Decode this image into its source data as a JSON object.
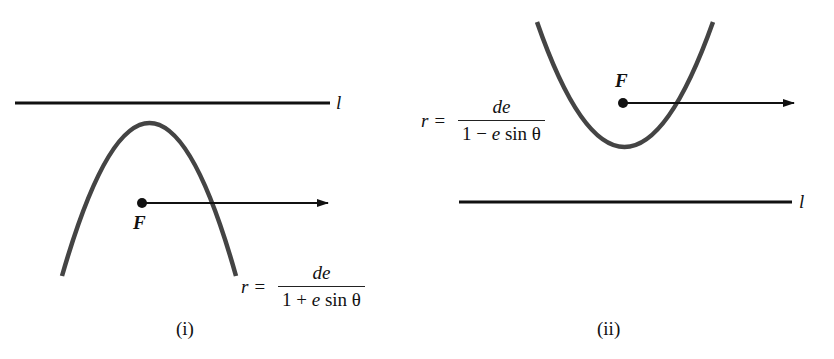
{
  "diagrams": [
    {
      "id": "i",
      "caption": "(i)",
      "directrix_label": "l",
      "focus_label": "F",
      "equation": {
        "lhs": "r =",
        "numerator": "de",
        "denominator_pre": "1 + ",
        "denominator_e": "e",
        "denominator_post": " sin θ"
      },
      "orientation": "opens downward, directrix above focus"
    },
    {
      "id": "ii",
      "caption": "(ii)",
      "directrix_label": "l",
      "focus_label": "F",
      "equation": {
        "lhs": "r =",
        "numerator": "de",
        "denominator_pre": "1 − ",
        "denominator_e": "e",
        "denominator_post": " sin θ"
      },
      "orientation": "opens upward, directrix below focus"
    }
  ]
}
